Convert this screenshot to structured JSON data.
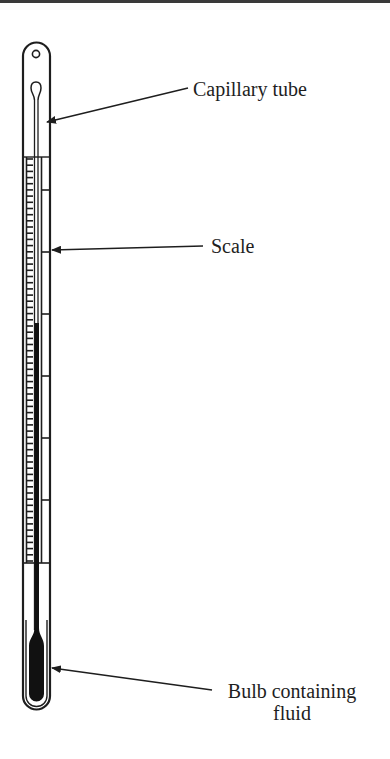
{
  "diagram": {
    "labels": {
      "capillary": "Capillary tube",
      "scale": "Scale",
      "bulb_line1": "Bulb containing",
      "bulb_line2": "fluid"
    },
    "colors": {
      "ink": "#1e1e1e",
      "background": "#ffffff",
      "fluid": "#111111"
    },
    "scale": {
      "major_divisions": 6,
      "minor_ticks_per_division": 10
    }
  }
}
